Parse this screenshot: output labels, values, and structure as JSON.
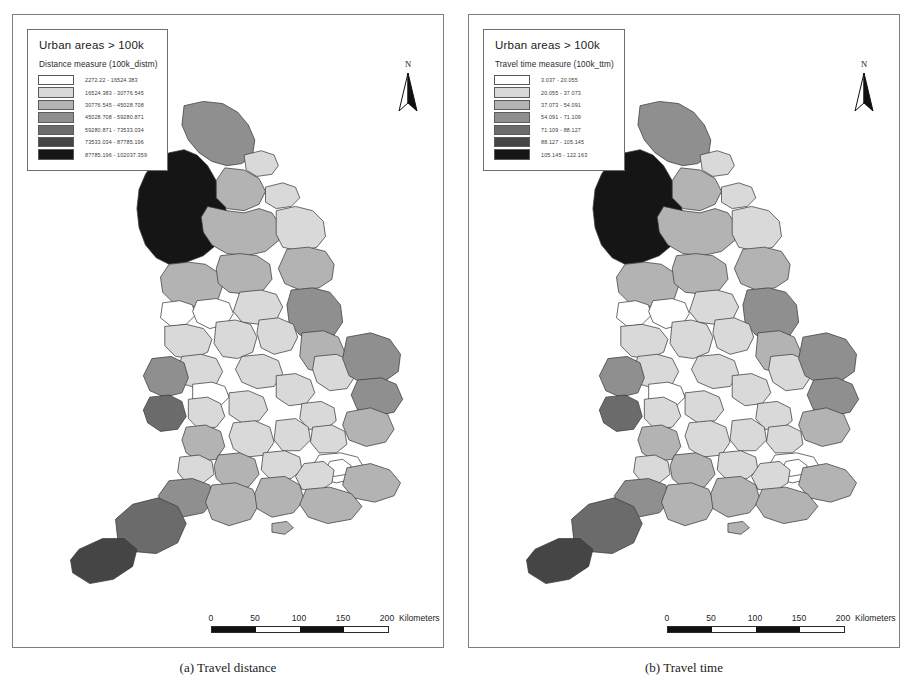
{
  "figure": {
    "panels": [
      {
        "id": "panel-a",
        "caption": "(a) Travel distance",
        "legend": {
          "title": "Urban areas > 100k",
          "subtitle": "Distance measure (100k_distm)",
          "classes": [
            {
              "label": "2272.22 - 16524.383",
              "color": "#ffffff"
            },
            {
              "label": "16524.383 - 30776.545",
              "color": "#d9d9d9"
            },
            {
              "label": "30776.545 - 45028.708",
              "color": "#b3b3b3"
            },
            {
              "label": "45028.708 - 59280.871",
              "color": "#8f8f8f"
            },
            {
              "label": "59280.871 - 73533.034",
              "color": "#6b6b6b"
            },
            {
              "label": "73533.034 - 87785.196",
              "color": "#454545"
            },
            {
              "label": "87785.196 - 102037.359",
              "color": "#151515"
            }
          ]
        },
        "north_label": "N",
        "scalebar": {
          "ticks": [
            "0",
            "50",
            "100",
            "150",
            "200"
          ],
          "units": "Kilometers"
        }
      },
      {
        "id": "panel-b",
        "caption": "(b) Travel time",
        "legend": {
          "title": "Urban areas > 100k",
          "subtitle": "Travel time measure (100k_ttm)",
          "classes": [
            {
              "label": "3.037 - 20.055",
              "color": "#ffffff"
            },
            {
              "label": "20.055 - 37.073",
              "color": "#d9d9d9"
            },
            {
              "label": "37.073 - 54.091",
              "color": "#b3b3b3"
            },
            {
              "label": "54.091 - 71.109",
              "color": "#8f8f8f"
            },
            {
              "label": "71.109 - 88.127",
              "color": "#6b6b6b"
            },
            {
              "label": "88.127 - 105.145",
              "color": "#454545"
            },
            {
              "label": "105.145 - 122.163",
              "color": "#151515"
            }
          ]
        },
        "north_label": "N",
        "scalebar": {
          "ticks": [
            "0",
            "50",
            "100",
            "150",
            "200"
          ],
          "units": "Kilometers"
        }
      }
    ]
  },
  "map_data": {
    "type": "choropleth",
    "region": "England and Wales",
    "unit": "districts",
    "class_count": 7,
    "features": [
      {
        "n": "cumbria",
        "d": "M 82 118 L 96 110 L 110 107 L 122 112 L 132 122 L 140 136 L 146 150 L 150 166 L 148 182 L 140 196 L 128 206 L 112 212 L 96 214 L 84 208 L 74 196 L 68 180 L 66 162 L 68 144 L 74 130 Z",
        "a": 6,
        "b": 6
      },
      {
        "n": "northumberland",
        "d": "M 110 66 L 128 62 L 146 64 L 160 72 L 170 84 L 176 98 L 174 112 L 164 120 L 150 122 L 136 118 L 124 110 L 114 98 L 108 84 Z",
        "a": 3,
        "b": 3
      },
      {
        "n": "tyne-wear",
        "d": "M 166 112 L 182 108 L 194 112 L 198 122 L 192 130 L 178 132 L 168 126 Z",
        "a": 1,
        "b": 1
      },
      {
        "n": "durham",
        "d": "M 148 124 L 166 126 L 180 134 L 186 146 L 180 158 L 166 164 L 150 162 L 140 152 L 140 136 Z",
        "a": 2,
        "b": 2
      },
      {
        "n": "n-yorkshire-west",
        "d": "M 132 160 L 150 164 L 166 166 L 180 162 L 192 166 L 200 178 L 198 192 L 186 202 L 168 206 L 150 204 L 136 196 L 128 184 L 126 170 Z",
        "a": 2,
        "b": 2
      },
      {
        "n": "n-yorkshire-east",
        "d": "M 196 164 L 214 160 L 230 164 L 240 174 L 242 188 L 234 198 L 218 202 L 202 198 L 196 186 Z",
        "a": 1,
        "b": 1
      },
      {
        "n": "teesside",
        "d": "M 186 142 L 202 138 L 214 142 L 218 152 L 210 160 L 196 162 L 186 156 Z",
        "a": 1,
        "b": 1
      },
      {
        "n": "lancashire",
        "d": "M 96 214 L 114 212 L 130 214 L 142 222 L 146 234 L 142 246 L 130 252 L 114 254 L 100 250 L 90 240 L 88 226 Z",
        "a": 2,
        "b": 2
      },
      {
        "n": "w-yorkshire",
        "d": "M 144 206 L 162 204 L 178 206 L 190 214 L 192 228 L 184 238 L 168 242 L 152 240 L 142 232 L 140 218 Z",
        "a": 2,
        "b": 2
      },
      {
        "n": "humberside",
        "d": "M 206 200 L 226 198 L 242 202 L 250 214 L 248 228 L 236 236 L 218 238 L 204 232 L 198 218 Z",
        "a": 2,
        "b": 2
      },
      {
        "n": "merseyside",
        "d": "M 90 250 L 106 248 L 118 252 L 120 262 L 112 270 L 98 272 L 88 264 Z",
        "a": 0,
        "b": 0
      },
      {
        "n": "gtr-manchester",
        "d": "M 122 248 L 140 246 L 152 250 L 156 260 L 150 270 L 134 274 L 122 268 L 118 258 Z",
        "a": 0,
        "b": 0
      },
      {
        "n": "s-yorkshire",
        "d": "M 162 240 L 182 238 L 196 242 L 202 254 L 196 266 L 180 270 L 164 268 L 156 258 Z",
        "a": 1,
        "b": 1
      },
      {
        "n": "lincolnshire-n",
        "d": "M 210 238 L 230 236 L 246 240 L 256 252 L 258 268 L 250 280 L 234 284 L 218 280 L 208 268 L 206 252 Z",
        "a": 3,
        "b": 3
      },
      {
        "n": "cheshire",
        "d": "M 92 272 L 112 270 L 128 274 L 136 284 L 132 296 L 118 302 L 102 300 L 92 290 Z",
        "a": 1,
        "b": 1
      },
      {
        "n": "derbyshire",
        "d": "M 140 268 L 158 266 L 172 270 L 178 282 L 174 296 L 160 302 L 146 300 L 138 288 Z",
        "a": 1,
        "b": 1
      },
      {
        "n": "nottinghamshire",
        "d": "M 180 266 L 198 264 L 212 270 L 216 282 L 210 294 L 194 298 L 182 292 L 178 278 Z",
        "a": 1,
        "b": 1
      },
      {
        "n": "lincolnshire-s",
        "d": "M 220 278 L 240 276 L 254 282 L 260 296 L 256 310 L 242 316 L 226 312 L 218 300 Z",
        "a": 2,
        "b": 2
      },
      {
        "n": "staffordshire",
        "d": "M 108 300 L 126 298 L 140 302 L 146 314 L 140 326 L 124 330 L 110 326 L 104 312 Z",
        "a": 1,
        "b": 1
      },
      {
        "n": "leicestershire",
        "d": "M 164 300 L 184 298 L 198 304 L 202 316 L 194 328 L 178 330 L 164 324 L 158 312 Z",
        "a": 1,
        "b": 1
      },
      {
        "n": "shropshire",
        "d": "M 80 302 L 98 300 L 110 306 L 114 320 L 108 334 L 92 338 L 78 332 L 72 318 Z",
        "a": 3,
        "b": 3
      },
      {
        "n": "w-midlands",
        "d": "M 118 326 L 136 324 L 148 328 L 152 338 L 144 346 L 128 348 L 118 340 Z",
        "a": 0,
        "b": 0
      },
      {
        "n": "northamptonshire",
        "d": "M 196 318 L 214 316 L 228 322 L 232 334 L 224 344 L 208 346 L 196 338 Z",
        "a": 1,
        "b": 1
      },
      {
        "n": "cambridgeshire",
        "d": "M 232 300 L 252 298 L 266 304 L 270 318 L 262 330 L 246 332 L 234 324 L 230 312 Z",
        "a": 1,
        "b": 1
      },
      {
        "n": "norfolk",
        "d": "M 262 282 L 284 278 L 302 284 L 312 298 L 310 314 L 296 324 L 278 326 L 264 318 L 258 302 Z",
        "a": 3,
        "b": 3
      },
      {
        "n": "suffolk",
        "d": "M 272 322 L 294 320 L 308 326 L 314 340 L 306 352 L 288 356 L 272 350 L 266 336 Z",
        "a": 3,
        "b": 3
      },
      {
        "n": "warwickshire",
        "d": "M 152 334 L 170 332 L 184 338 L 188 350 L 180 360 L 164 362 L 152 354 Z",
        "a": 1,
        "b": 1
      },
      {
        "n": "herefordshire",
        "d": "M 78 338 L 96 336 L 108 342 L 112 356 L 104 368 L 88 370 L 76 362 L 72 350 Z",
        "a": 4,
        "b": 4
      },
      {
        "n": "worcestershire",
        "d": "M 114 340 L 132 338 L 144 344 L 148 356 L 140 366 L 124 368 L 114 358 Z",
        "a": 1,
        "b": 1
      },
      {
        "n": "bedfordshire",
        "d": "M 220 344 L 238 342 L 250 348 L 252 360 L 242 368 L 226 368 L 218 358 Z",
        "a": 1,
        "b": 1
      },
      {
        "n": "essex",
        "d": "M 262 352 L 284 348 L 300 354 L 306 368 L 298 380 L 280 384 L 264 378 L 258 364 Z",
        "a": 2,
        "b": 2
      },
      {
        "n": "gloucestershire",
        "d": "M 112 366 L 130 364 L 144 370 L 148 384 L 140 396 L 124 398 L 112 390 L 108 378 Z",
        "a": 2,
        "b": 2
      },
      {
        "n": "oxfordshire",
        "d": "M 156 362 L 176 360 L 190 366 L 194 380 L 186 392 L 168 394 L 156 386 L 152 374 Z",
        "a": 1,
        "b": 1
      },
      {
        "n": "buckinghamshire",
        "d": "M 196 360 L 214 358 L 226 366 L 228 378 L 218 388 L 202 388 L 194 378 Z",
        "a": 1,
        "b": 1
      },
      {
        "n": "hertfordshire",
        "d": "M 230 366 L 248 364 L 260 370 L 262 382 L 252 390 L 236 390 L 228 380 Z",
        "a": 1,
        "b": 1
      },
      {
        "n": "greater-london",
        "d": "M 236 392 L 256 390 L 272 394 L 278 404 L 270 414 L 252 418 L 236 414 L 230 402 Z",
        "a": 0,
        "b": 0
      },
      {
        "n": "london-core",
        "d": "M 246 398 L 258 396 L 266 402 L 262 410 L 250 412 L 242 406 Z",
        "a": 0,
        "b": 0
      },
      {
        "n": "avon",
        "d": "M 106 394 L 124 392 L 136 398 L 138 410 L 128 418 L 112 418 L 104 408 Z",
        "a": 1,
        "b": 1
      },
      {
        "n": "wiltshire",
        "d": "M 142 392 L 162 390 L 176 396 L 180 410 L 170 422 L 152 424 L 140 414 L 138 402 Z",
        "a": 2,
        "b": 2
      },
      {
        "n": "berkshire",
        "d": "M 184 390 L 204 388 L 218 394 L 220 406 L 210 414 L 192 416 L 182 406 Z",
        "a": 1,
        "b": 1
      },
      {
        "n": "surrey",
        "d": "M 222 400 L 240 398 L 250 406 L 248 418 L 236 426 L 220 424 L 214 412 Z",
        "a": 1,
        "b": 1
      },
      {
        "n": "kent",
        "d": "M 262 404 L 284 400 L 302 406 L 312 418 L 306 430 L 288 436 L 268 432 L 258 420 Z",
        "a": 2,
        "b": 2
      },
      {
        "n": "somerset",
        "d": "M 96 416 L 118 414 L 134 420 L 138 434 L 128 446 L 108 450 L 92 444 L 86 430 Z",
        "a": 3,
        "b": 3
      },
      {
        "n": "dorset",
        "d": "M 136 420 L 158 418 L 174 424 L 180 438 L 172 452 L 152 458 L 136 452 L 130 436 Z",
        "a": 2,
        "b": 2
      },
      {
        "n": "hampshire",
        "d": "M 182 414 L 204 412 L 218 420 L 222 434 L 212 446 L 192 450 L 178 442 L 176 428 Z",
        "a": 2,
        "b": 2
      },
      {
        "n": "sussex",
        "d": "M 224 424 L 246 422 L 266 428 L 276 440 L 266 452 L 244 456 L 226 450 L 218 438 Z",
        "a": 2,
        "b": 2
      },
      {
        "n": "devon",
        "d": "M 62 438 L 86 432 L 104 440 L 112 456 L 104 474 L 84 484 L 62 482 L 48 470 L 46 452 Z",
        "a": 4,
        "b": 4
      },
      {
        "n": "cornwall",
        "d": "M 12 480 L 34 470 L 54 470 L 66 480 L 62 496 L 44 508 L 22 512 L 6 502 L 4 490 Z",
        "a": 5,
        "b": 5
      },
      {
        "n": "isle-of-wight",
        "d": "M 192 456 L 206 454 L 212 460 L 204 466 L 192 464 Z",
        "a": 2,
        "b": 2
      }
    ]
  }
}
